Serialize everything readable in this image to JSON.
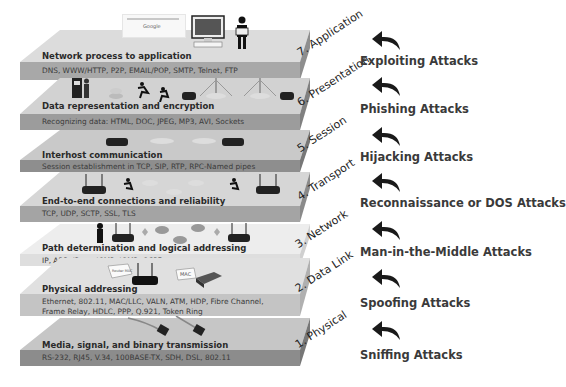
{
  "layers": [
    {
      "number": 7,
      "label": "7. Application",
      "title": "Network process to application",
      "protocols": "DNS, WWW/HTTP, P2P, EMAIL/POP, SMTP, Telnet, FTP",
      "attack": "Exploiting Attacks",
      "color": "#d9d9d9",
      "band": "#a6a6a6"
    },
    {
      "number": 6,
      "label": "6. Presentation",
      "title": "Data representation and encryption",
      "protocols": "Recognizing data: HTML, DOC, JPEG, MP3, AVI, Sockets",
      "attack": "Phishing Attacks",
      "color": "#d0d0d0",
      "band": "#9a9a9a"
    },
    {
      "number": 5,
      "label": "5. Session",
      "title": "Interhost communication",
      "protocols": "Session establishment in TCP, SIP, RTP, RPC-Named pipes",
      "attack": "Hijacking Attacks",
      "color": "#c8c8c8",
      "band": "#8c8c8c"
    },
    {
      "number": 4,
      "label": "4. Transport",
      "title": "End-to-end connections and reliability",
      "protocols": "TCP, UDP, SCTP, SSL, TLS",
      "attack": "Reconnaissance or DOS Attacks",
      "color": "#d6d6d6",
      "band": "#a3a3a3"
    },
    {
      "number": 3,
      "label": "3. Network",
      "title": "Path determination and logical addressing",
      "protocols": "IP, ARP, IPsec, ICMP, IGMP, OSPF",
      "attack": "Man-in-the-Middle Attacks",
      "color": "#ececec",
      "band": "#dcdcdc"
    },
    {
      "number": 2,
      "label": "2. Data Link",
      "title": "Physical addressing",
      "protocols_lines": [
        "Ethernet, 802.11, MAC/LLC, VALN, ATM, HDP, Fibre Channel,",
        "Frame Relay, HDLC,  PPP, Q.921, Token Ring"
      ],
      "attack": "Spoofing Attacks",
      "color": "#dedede",
      "band": "#c2c2c2"
    },
    {
      "number": 1,
      "label": "1. Physical",
      "title": "Media, signal, and binary transmission",
      "protocols": "RS-232, RJ45, V.34, 100BASE-TX, SDH, DSL, 802.11",
      "attack": "Sniffing Attacks",
      "color": "#c4c4c4",
      "band": "#8a8a8a"
    }
  ],
  "icons": {
    "search_box_text": "Google",
    "mac_tag": "MAC",
    "router_tag": "Router MAC"
  }
}
